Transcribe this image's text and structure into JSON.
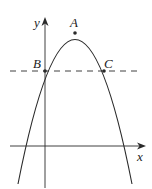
{
  "diagram": {
    "type": "parabola-graph",
    "colors": {
      "stroke": "#2a2a2a",
      "background": "#ffffff"
    },
    "axes": {
      "x_label": "x",
      "y_label": "y"
    },
    "points": [
      {
        "id": "A",
        "label": "A",
        "description": "vertex of parabola"
      },
      {
        "id": "B",
        "label": "B",
        "description": "intersection of parabola, y-axis and dashed line"
      },
      {
        "id": "C",
        "label": "C",
        "description": "intersection of parabola and dashed line"
      }
    ],
    "dashed_line": {
      "description": "horizontal line through B and C"
    }
  }
}
